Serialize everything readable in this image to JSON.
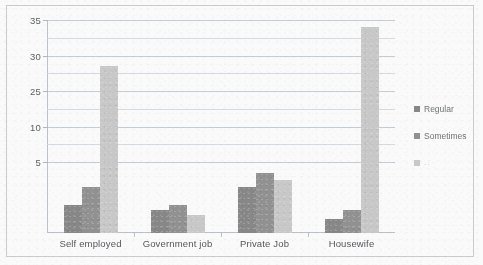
{
  "chart_data": {
    "type": "bar",
    "title": "",
    "subtitle": "",
    "xlabel": "",
    "ylabel": "",
    "categories": [
      "Self employed",
      "Government job",
      "Private Job",
      "Housewife"
    ],
    "series": [
      {
        "name": "Regular",
        "color": "#858585",
        "values": [
          9,
          8.2,
          11.5,
          7
        ]
      },
      {
        "name": "Sometimes",
        "color": "#8f8f8f",
        "values": [
          11.5,
          9,
          13.5,
          8.3
        ]
      },
      {
        "name": "..",
        "color": "#c9c9c9",
        "values": [
          28.5,
          7.5,
          12.5,
          34
        ]
      }
    ],
    "ylim": [
      5,
      35
    ],
    "ytick_labels": [
      "35",
      "30",
      "25",
      "10",
      "5"
    ],
    "ytick_values": [
      35,
      30,
      25,
      20,
      15
    ],
    "gridline_values": [
      35,
      32.5,
      30,
      27.5,
      25,
      22.5,
      20,
      17.5,
      15
    ],
    "grid": true,
    "legend_position": "right",
    "legend_entries": [
      "Regular",
      "Sometimes",
      ".."
    ],
    "axis_line_color": "#b9c2cb",
    "grid_color": "#ccd6e0",
    "border_color": "#c9cdd3",
    "background": "#fefefe"
  },
  "legend": {
    "items": [
      {
        "label": "Regular"
      },
      {
        "label": "Sometimes"
      },
      {
        "label": ".."
      }
    ]
  }
}
